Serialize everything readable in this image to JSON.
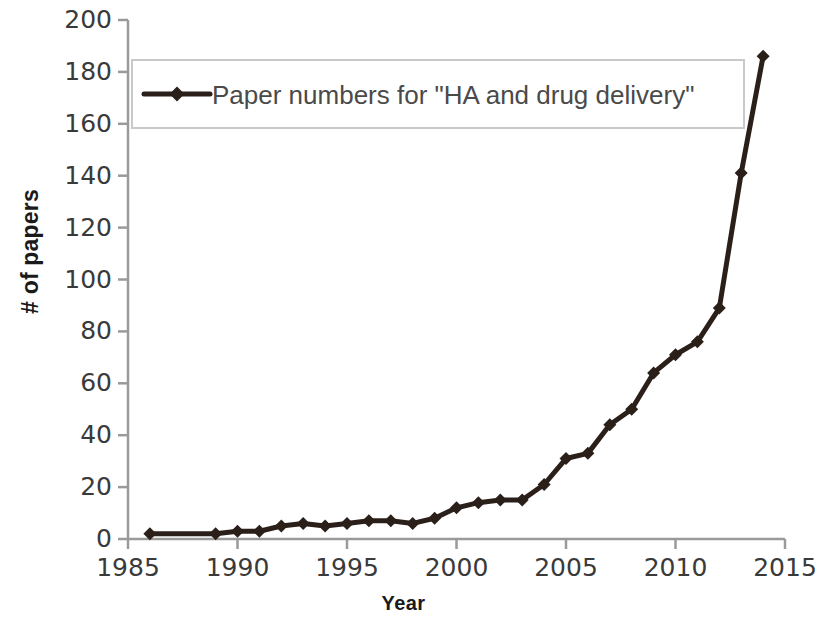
{
  "chart_data": {
    "type": "line",
    "title": "",
    "subtitle": "",
    "xlabel": "Year",
    "ylabel": "# of papers",
    "xlim": [
      1985,
      2015
    ],
    "ylim": [
      0,
      200
    ],
    "xticks": [
      1985,
      1990,
      1995,
      2000,
      2005,
      2010,
      2015
    ],
    "xtick_labels": [
      "1985",
      "1990",
      "1995",
      "2000",
      "2005",
      "2010",
      "2015"
    ],
    "yticks": [
      0,
      20,
      40,
      60,
      80,
      100,
      120,
      140,
      160,
      180,
      200
    ],
    "ytick_labels": [
      "0",
      "20",
      "40",
      "60",
      "80",
      "100",
      "120",
      "140",
      "160",
      "180",
      "200"
    ],
    "grid": false,
    "legend_position": "upper-left-inside",
    "series": [
      {
        "name": "Paper numbers for \"HA and drug delivery\"",
        "color": "#2b1f1a",
        "marker": "diamond",
        "x": [
          1986,
          1989,
          1990,
          1991,
          1992,
          1993,
          1994,
          1995,
          1996,
          1997,
          1998,
          1999,
          2000,
          2001,
          2002,
          2003,
          2004,
          2005,
          2006,
          2007,
          2008,
          2009,
          2010,
          2011,
          2012,
          2013,
          2014
        ],
        "values": [
          2,
          2,
          3,
          3,
          5,
          6,
          5,
          6,
          7,
          7,
          6,
          8,
          12,
          14,
          15,
          15,
          21,
          31,
          33,
          44,
          50,
          64,
          71,
          76,
          89,
          141,
          186
        ]
      }
    ]
  },
  "legend": {
    "entries": [
      {
        "label": "Paper numbers for \"HA and drug delivery\"",
        "color": "#2b1f1a"
      }
    ]
  },
  "axes": {
    "x_title": "Year",
    "y_title": "# of papers"
  }
}
